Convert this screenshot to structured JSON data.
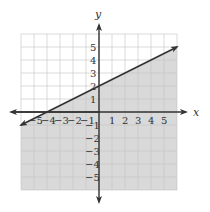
{
  "chart_data": {
    "type": "line",
    "title": "",
    "xlabel": "x",
    "ylabel": "y",
    "xlim": [
      -6,
      6
    ],
    "ylim": [
      -6,
      6
    ],
    "x_ticks": [
      -5,
      -4,
      -3,
      -2,
      -1,
      1,
      2,
      3,
      4,
      5
    ],
    "y_ticks": [
      -5,
      -4,
      -3,
      -2,
      -1,
      1,
      2,
      3,
      4,
      5
    ],
    "grid": true,
    "series": [
      {
        "name": "boundary line y = (1/2)x + 2",
        "style": "solid",
        "points": [
          [
            -6,
            -1
          ],
          [
            -4,
            0
          ],
          [
            0,
            2
          ],
          [
            6,
            5
          ]
        ]
      }
    ],
    "shaded_region": "below the line (y ≤ (1/2)x + 2)",
    "colors": {
      "shade": "#d9d9d9",
      "grid": "#bdbdbd",
      "axis": "#333333",
      "line": "#333333"
    }
  },
  "axes": {
    "x_label": "x",
    "y_label": "y"
  },
  "x_tick_labels": [
    "−5",
    "−4",
    "−3",
    "−2",
    "−1",
    "1",
    "2",
    "3",
    "4",
    "5"
  ],
  "y_tick_labels": [
    "5",
    "4",
    "3",
    "2",
    "1",
    "−1",
    "−2",
    "−3",
    "−4",
    "−5"
  ]
}
